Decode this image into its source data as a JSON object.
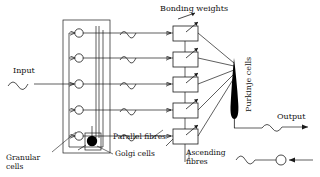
{
  "diagram": {
    "title_label": "Bonding weights",
    "background_color": "#ffffff",
    "ink_color": "#1a1a1a",
    "labels": {
      "input": "Input",
      "output": "Output",
      "bonding_weights": "Bonding weights",
      "granular_cells": "Granular\ncells",
      "golgi_cells": "Golgi cells",
      "parallel_fibres": "Parallel fibres",
      "ascending_fibres": "Ascending\nfibres",
      "purkinje_cells": "Purkinje cells"
    },
    "granular_cells": {
      "name": "granular-cell",
      "count": 5,
      "fill": "#ffffff",
      "stroke": "#1a1a1a",
      "radius": 4.2,
      "cx": 79,
      "cy_list": [
        33,
        58,
        84,
        110,
        136
      ]
    },
    "golgi_cell": {
      "name": "golgi-cell",
      "fill": "#000000",
      "cx": 92,
      "cy": 141,
      "radius": 5.2
    },
    "bonding_weight_boxes": {
      "count": 5,
      "x": 173,
      "width": 25,
      "height": 15,
      "fill": "#ffffff",
      "stroke": "#1a1a1a",
      "y_list": [
        26,
        52,
        77,
        103,
        129
      ]
    },
    "purkinje_cell": {
      "name": "purkinje-cell",
      "fill": "#000000",
      "apex_x": 234,
      "apex_y": 60,
      "base_y": 118
    },
    "feedback_node": {
      "name": "feedback-node",
      "cx": 281,
      "cy": 160,
      "radius": 5,
      "fill": "#ffffff"
    },
    "signal_waves": [
      {
        "name": "input-wave",
        "x": 18,
        "y": 86
      },
      {
        "name": "parallel-fibre-wave-1",
        "x": 127,
        "y": 33
      },
      {
        "name": "parallel-fibre-wave-2",
        "x": 127,
        "y": 58
      },
      {
        "name": "parallel-fibre-wave-3",
        "x": 127,
        "y": 84
      },
      {
        "name": "parallel-fibre-wave-4",
        "x": 127,
        "y": 110
      },
      {
        "name": "parallel-fibre-wave-5",
        "x": 127,
        "y": 136
      },
      {
        "name": "output-wave",
        "x": 272,
        "y": 122
      },
      {
        "name": "feedback-wave",
        "x": 245,
        "y": 160
      }
    ]
  }
}
